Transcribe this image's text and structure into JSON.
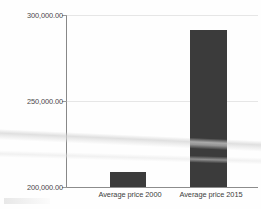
{
  "chart_data": {
    "type": "bar",
    "title": "",
    "subtitle": "",
    "xlabel": "",
    "ylabel": "",
    "categories": [
      "Average price 2000",
      "Average price 2015"
    ],
    "values": [
      208500,
      291000
    ],
    "series": [
      {
        "name": "Average price",
        "values": [
          208500,
          291000
        ]
      }
    ],
    "ylim": [
      200000,
      300000
    ],
    "yticks": [
      200000,
      250000,
      300000
    ],
    "ytick_labels": [
      "200,000.00",
      "250,000.00",
      "300,000.00"
    ],
    "grid": true,
    "grid_axis": "y",
    "legend": false,
    "legend_position": "none",
    "bar_color": "#3b3b3b",
    "axis_color": "#8c8c8c",
    "grid_color": "#e6e6e6",
    "background_color": "#fefefe",
    "annotations": []
  },
  "axis": {
    "y_tick_top": "300,000.00",
    "y_tick_mid": "250,000.00",
    "y_tick_bottom": "200,000.00"
  },
  "bars": [
    {
      "label": "Average price 2000",
      "value": 208500
    },
    {
      "label": "Average price 2015",
      "value": 291000
    }
  ]
}
